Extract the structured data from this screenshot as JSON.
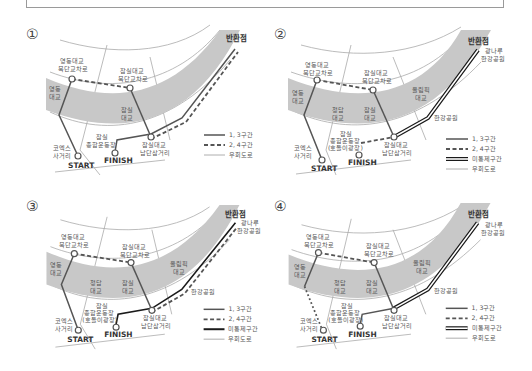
{
  "panels": [
    {
      "number": "①",
      "labels": {
        "turnaround": "반환점",
        "yeongdong_north": [
          "영동대교",
          "북단교차로"
        ],
        "jamsil_north": [
          "잠실대교",
          "북단교차로"
        ],
        "yeongdong_bridge": [
          "영동",
          "대교"
        ],
        "jamsil_bridge": [
          "잠실",
          "대교"
        ],
        "coex": [
          "코엑스",
          "사거리"
        ],
        "stadium": [
          "잠실",
          "종합운동장"
        ],
        "jamsil_south": [
          "잠실대교",
          "남단삼거리"
        ],
        "start": "START",
        "finish": "FINISH"
      },
      "legend": [
        "1, 3구간",
        "2, 4구간",
        "우회도로"
      ]
    },
    {
      "number": "②",
      "labels": {
        "turnaround": "반환점",
        "gwangnaru": [
          "광나루",
          "한강공원"
        ],
        "yeongdong_north": [
          "영동대교",
          "북단교차로"
        ],
        "jamsil_north": [
          "잠실대교",
          "북단교차로"
        ],
        "yeongdong_bridge": [
          "영동",
          "대교"
        ],
        "cheongdam_bridge": [
          "청담",
          "대교"
        ],
        "jamsil_bridge": [
          "잠실",
          "대교"
        ],
        "olympic_bridge": [
          "올림픽",
          "대교"
        ],
        "hangang_park": "한강공원",
        "coex": [
          "코엑스",
          "사거리"
        ],
        "stadium": [
          "잠실",
          "종합운동장",
          "(호돌이광장)"
        ],
        "jamsil_south": [
          "잠실대교",
          "남단삼거리"
        ],
        "start": "START",
        "finish": "FINISH"
      },
      "legend": [
        "1, 3구간",
        "2, 4구간",
        "미통제구간",
        "우회도로"
      ]
    },
    {
      "number": "③",
      "labels": {
        "turnaround": "반환점",
        "gwangnaru": [
          "광나루",
          "한강공원"
        ],
        "yeongdong_north": [
          "영동대교",
          "북단교차로"
        ],
        "jamsil_north": [
          "잠실대교",
          "북단교차로"
        ],
        "yeongdong_bridge": [
          "영동",
          "대교"
        ],
        "cheongdam_bridge": [
          "청담",
          "대교"
        ],
        "jamsil_bridge": [
          "잠실",
          "대교"
        ],
        "olympic_bridge": [
          "올림픽",
          "대교"
        ],
        "hangang_park": "한강공원",
        "coex": [
          "코엑스",
          "사거리"
        ],
        "stadium": [
          "잠실",
          "종합운동장",
          "(호돌이광장)"
        ],
        "jamsil_south": [
          "잠실대교",
          "남단삼거리"
        ],
        "start": "START",
        "finish": "FINISH"
      },
      "legend": [
        "1, 3구간",
        "2, 4구간",
        "미통제구간",
        "우회도로"
      ]
    },
    {
      "number": "④",
      "labels": {
        "turnaround": "반환점",
        "gwangnaru": [
          "광나루",
          "한강공원"
        ],
        "yeongdong_north": [
          "영동대교",
          "북단교차로"
        ],
        "jamsil_north": [
          "잠실대교",
          "북단교차로"
        ],
        "yeongdong_bridge": [
          "영동",
          "대교"
        ],
        "cheongdam_bridge": [
          "청담",
          "대교"
        ],
        "jamsil_bridge": [
          "잠실",
          "대교"
        ],
        "olympic_bridge": [
          "올림픽",
          "대교"
        ],
        "hangang_park": "한강공원",
        "coex": [
          "코엑스",
          "사거리"
        ],
        "stadium": [
          "잠실",
          "종합운동장",
          "(호돌이광장)"
        ],
        "jamsil_south": [
          "잠실대교",
          "남단삼거리"
        ],
        "start": "START",
        "finish": "FINISH"
      },
      "legend": [
        "1, 3구간",
        "2, 4구간",
        "미통제구간",
        "우회도로"
      ]
    }
  ],
  "colors": {
    "river": "#c8c8c8",
    "route": "#555555",
    "uncontrolled": "#1a1a1a",
    "road": "#9a9a9a"
  }
}
